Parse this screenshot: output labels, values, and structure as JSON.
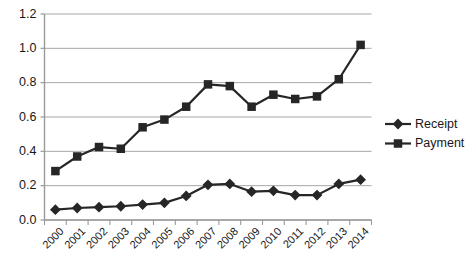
{
  "chart_data": {
    "type": "line",
    "title": "",
    "xlabel": "",
    "ylabel": "",
    "categories": [
      "2000",
      "2001",
      "2002",
      "2003",
      "2004",
      "2005",
      "2006",
      "2007",
      "2008",
      "2009",
      "2010",
      "2011",
      "2012",
      "2013",
      "2014"
    ],
    "series": [
      {
        "name": "Receipt",
        "marker": "diamond",
        "color": "#262626",
        "values": [
          0.06,
          0.07,
          0.075,
          0.08,
          0.09,
          0.1,
          0.14,
          0.205,
          0.21,
          0.165,
          0.17,
          0.145,
          0.145,
          0.21,
          0.235
        ]
      },
      {
        "name": "Payment",
        "marker": "square",
        "color": "#262626",
        "values": [
          0.285,
          0.37,
          0.425,
          0.415,
          0.54,
          0.585,
          0.66,
          0.79,
          0.78,
          0.66,
          0.73,
          0.705,
          0.72,
          0.82,
          1.02
        ]
      }
    ],
    "ylim": [
      0.0,
      1.2
    ],
    "ytick_labels": [
      "0.0",
      "0.2",
      "0.4",
      "0.6",
      "0.8",
      "1.0",
      "1.2"
    ],
    "ytick_values": [
      0.0,
      0.2,
      0.4,
      0.6,
      0.8,
      1.0,
      1.2
    ],
    "grid": true,
    "grid_axis": "y",
    "legend_position": "right",
    "legend": [
      "Receipt",
      "Payment"
    ],
    "axis_color": "#9a9a9a",
    "grid_color": "#a6a6a6",
    "background": "#ffffff"
  }
}
